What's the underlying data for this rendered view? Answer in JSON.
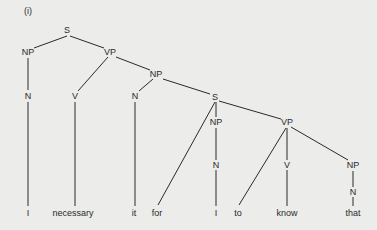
{
  "title": "(i)",
  "colors": {
    "background": "#ececeb",
    "ink": "#2a2a2a"
  },
  "nodes": [
    {
      "id": "s1",
      "label": "S",
      "x": 67,
      "y": 30
    },
    {
      "id": "np1",
      "label": "NP",
      "x": 28,
      "y": 52
    },
    {
      "id": "vp1",
      "label": "VP",
      "x": 110,
      "y": 52
    },
    {
      "id": "n1",
      "label": "N",
      "x": 28,
      "y": 96
    },
    {
      "id": "v1",
      "label": "V",
      "x": 75,
      "y": 96
    },
    {
      "id": "np2",
      "label": "NP",
      "x": 156,
      "y": 74
    },
    {
      "id": "n2",
      "label": "N",
      "x": 135,
      "y": 96
    },
    {
      "id": "s2",
      "label": "S",
      "x": 215,
      "y": 97
    },
    {
      "id": "np3",
      "label": "NP",
      "x": 216,
      "y": 122
    },
    {
      "id": "vp2",
      "label": "VP",
      "x": 287,
      "y": 122
    },
    {
      "id": "n3",
      "label": "N",
      "x": 216,
      "y": 165
    },
    {
      "id": "v2",
      "label": "V",
      "x": 287,
      "y": 165
    },
    {
      "id": "np4",
      "label": "NP",
      "x": 353,
      "y": 165
    },
    {
      "id": "n4",
      "label": "N",
      "x": 353,
      "y": 192
    },
    {
      "id": "w1",
      "label": "I",
      "x": 28,
      "y": 213
    },
    {
      "id": "w2",
      "label": "necessary",
      "x": 73,
      "y": 213
    },
    {
      "id": "w3",
      "label": "it",
      "x": 134,
      "y": 213
    },
    {
      "id": "w4",
      "label": "for",
      "x": 157,
      "y": 213
    },
    {
      "id": "w5",
      "label": "I",
      "x": 216,
      "y": 213
    },
    {
      "id": "w6",
      "label": "to",
      "x": 238,
      "y": 213
    },
    {
      "id": "w7",
      "label": "know",
      "x": 287,
      "y": 213
    },
    {
      "id": "w8",
      "label": "that",
      "x": 353,
      "y": 213
    }
  ],
  "edges": [
    [
      67,
      36,
      34,
      48
    ],
    [
      70,
      36,
      104,
      48
    ],
    [
      28,
      58,
      28,
      90
    ],
    [
      28,
      102,
      28,
      206
    ],
    [
      108,
      57,
      78,
      91
    ],
    [
      116,
      57,
      150,
      70
    ],
    [
      75,
      102,
      75,
      206
    ],
    [
      153,
      79,
      139,
      91
    ],
    [
      163,
      79,
      210,
      94
    ],
    [
      135,
      102,
      135,
      206
    ],
    [
      215,
      102,
      158,
      205
    ],
    [
      216,
      102,
      216,
      117
    ],
    [
      216,
      128,
      216,
      160
    ],
    [
      216,
      170,
      216,
      206
    ],
    [
      219,
      101,
      281,
      119
    ],
    [
      286,
      128,
      239,
      205
    ],
    [
      287,
      128,
      287,
      160
    ],
    [
      287,
      170,
      287,
      206
    ],
    [
      291,
      127,
      348,
      160
    ],
    [
      353,
      171,
      353,
      187
    ],
    [
      353,
      197,
      353,
      206
    ]
  ]
}
